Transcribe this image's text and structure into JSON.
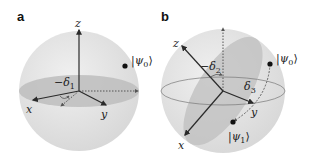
{
  "figure": {
    "panels": [
      {
        "id": "a",
        "label": "a",
        "axes": {
          "z": "z",
          "x": "x",
          "y": "y"
        },
        "angle_label": {
          "sign": "−",
          "symbol": "δ",
          "sub": "1"
        },
        "states": [
          {
            "ket_open": "|",
            "psi": "ψ",
            "sub": "0",
            "ket_close": "⟩"
          }
        ]
      },
      {
        "id": "b",
        "label": "b",
        "axes": {
          "z": "z",
          "x": "x",
          "y": "y"
        },
        "angle_label": {
          "sign": "−",
          "symbol": "δ",
          "sub": "2"
        },
        "rotation_label": {
          "symbol": "δ",
          "sub": "3"
        },
        "states": [
          {
            "ket_open": "|",
            "psi": "ψ",
            "sub": "0",
            "ket_close": "⟩"
          },
          {
            "ket_open": "|",
            "psi": "ψ",
            "sub": "1",
            "ket_close": "⟩"
          }
        ]
      }
    ],
    "colors": {
      "sphere": "#e3e3e3",
      "disc": "#b9b9b9",
      "plane": "#c4c4c4",
      "axis": "#2a2a2a",
      "point": "#111111"
    }
  }
}
